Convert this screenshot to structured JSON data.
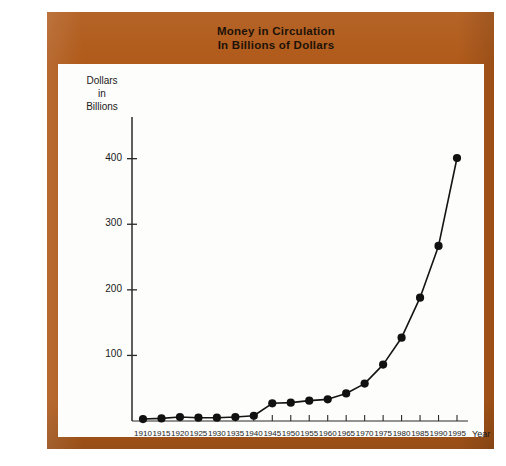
{
  "title": {
    "line1": "Money in Circulation",
    "line2": "In Billions of Dollars"
  },
  "colors": {
    "frame": "#b05a1a",
    "panel": "#fdfdfb",
    "ink": "#1a1a1a",
    "title_text": "#1d1208"
  },
  "axes": {
    "y_title_lines": [
      "Dollars",
      "in",
      "Billions"
    ],
    "x_title": "Year"
  },
  "chart_data": {
    "type": "line",
    "title": "Money in Circulation In Billions of Dollars",
    "xlabel": "Year",
    "ylabel": "Dollars in Billions",
    "xlim": [
      1910,
      1995
    ],
    "ylim": [
      0,
      430
    ],
    "grid": false,
    "legend": "none",
    "markers": "filled-circle",
    "y_ticks": [
      100,
      200,
      300,
      400
    ],
    "x_ticks": [
      1910,
      1915,
      1920,
      1925,
      1930,
      1935,
      1940,
      1945,
      1950,
      1955,
      1960,
      1965,
      1970,
      1975,
      1980,
      1985,
      1990,
      1995
    ],
    "x": [
      1910,
      1915,
      1920,
      1925,
      1930,
      1935,
      1940,
      1945,
      1950,
      1955,
      1960,
      1965,
      1970,
      1975,
      1980,
      1985,
      1990,
      1995
    ],
    "values": [
      3,
      4,
      6,
      5,
      5,
      6,
      8,
      27,
      28,
      31,
      33,
      42,
      57,
      86,
      127,
      188,
      267,
      401
    ],
    "series": [
      {
        "name": "Money in Circulation",
        "values": [
          3,
          4,
          6,
          5,
          5,
          6,
          8,
          27,
          28,
          31,
          33,
          42,
          57,
          86,
          127,
          188,
          267,
          401
        ]
      }
    ]
  }
}
